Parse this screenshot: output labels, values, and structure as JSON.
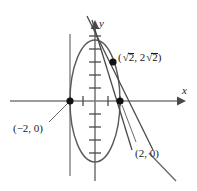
{
  "figure": {
    "name": "ellipse-with-tangent-line-diagram",
    "background_color": "#ffffff",
    "ink_color": "#1b1b1b",
    "curve_color": "#555555",
    "axis_color": "#777777",
    "width": 197,
    "height": 191
  },
  "axes": {
    "x_label": "x",
    "y_label": "y",
    "origin_px": {
      "x": 95,
      "y": 101
    },
    "x_arrow_tip_px": {
      "x": 180,
      "y": 101
    },
    "y_arrow_tip_px": {
      "x": 95,
      "y": 22
    },
    "tick_spacing_px": 13,
    "x_ticks_px": [
      -25,
      -12,
      12,
      25
    ],
    "y_ticks_px": [
      -65,
      -52,
      -39,
      -26,
      -13,
      13,
      26,
      39,
      52
    ],
    "grid": false
  },
  "points": [
    {
      "id": "point-sqrt2",
      "label": "(√2,  2√2)",
      "label_parts": {
        "open": "(",
        "x_coef": "",
        "x_radicand": "2",
        "sep": ",  ",
        "y_coef": "2",
        "y_radicand": "2",
        "close": ")"
      },
      "px": {
        "x": 113,
        "y": 62
      },
      "marker": "filled-dot"
    },
    {
      "id": "point-neg2-0",
      "label": "(−2, 0)",
      "px": {
        "x": 70,
        "y": 101
      },
      "marker": "filled-dot"
    },
    {
      "id": "point-pos2-0",
      "label": "(2, 0)",
      "px": {
        "x": 120,
        "y": 101
      },
      "marker": "filled-dot"
    }
  ],
  "curves": [
    {
      "id": "ellipse",
      "type": "ellipse",
      "center_px": {
        "x": 95,
        "y": 101
      },
      "rx": 25,
      "ry": 61
    },
    {
      "id": "tangent-line",
      "type": "line",
      "from_px": {
        "x": 88,
        "y": 18
      },
      "to_px": {
        "x": 152,
        "y": 148
      }
    },
    {
      "id": "secant-line",
      "type": "line",
      "from_px": {
        "x": 92,
        "y": 22
      },
      "to_px": {
        "x": 131,
        "y": 148
      }
    },
    {
      "id": "line-segment-lower-right",
      "type": "segment",
      "from_px": {
        "x": 148,
        "y": 152
      },
      "to_px": {
        "x": 176,
        "y": 180
      }
    },
    {
      "id": "vertical-line-x-neg2",
      "type": "line",
      "from_px": {
        "x": 70,
        "y": 34
      },
      "to_px": {
        "x": 70,
        "y": 176
      }
    },
    {
      "id": "leader-neg2",
      "type": "segment",
      "from_px": {
        "x": 68,
        "y": 103
      },
      "to_px": {
        "x": 50,
        "y": 122
      }
    },
    {
      "id": "leader-pos2",
      "type": "segment",
      "from_px": {
        "x": 121,
        "y": 104
      },
      "to_px": {
        "x": 135,
        "y": 143
      }
    }
  ]
}
